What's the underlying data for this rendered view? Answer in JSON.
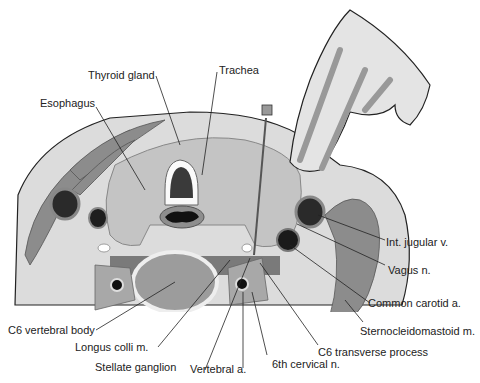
{
  "labels": {
    "thyroid_gland": "Thyroid gland",
    "trachea": "Trachea",
    "esophagus": "Esophagus",
    "int_jugular": "Int. jugular v.",
    "vagus": "Vagus n.",
    "common_carotid": "Common carotid a.",
    "scm": "Sternocleidomastoid m.",
    "c6_transverse": "C6 transverse process",
    "sixth_cervical": "6th cervical n.",
    "vertebral_a": "Vertebral a.",
    "stellate": "Stellate ganglion",
    "longus_colli": "Longus colli m.",
    "c6_body": "C6 vertebral body"
  },
  "colors": {
    "skin": "#d9d9d9",
    "tissue": "#c8c8c8",
    "muscle": "#8a8a8a",
    "vessel_dark": "#2a2a2a",
    "outline": "#222222"
  }
}
